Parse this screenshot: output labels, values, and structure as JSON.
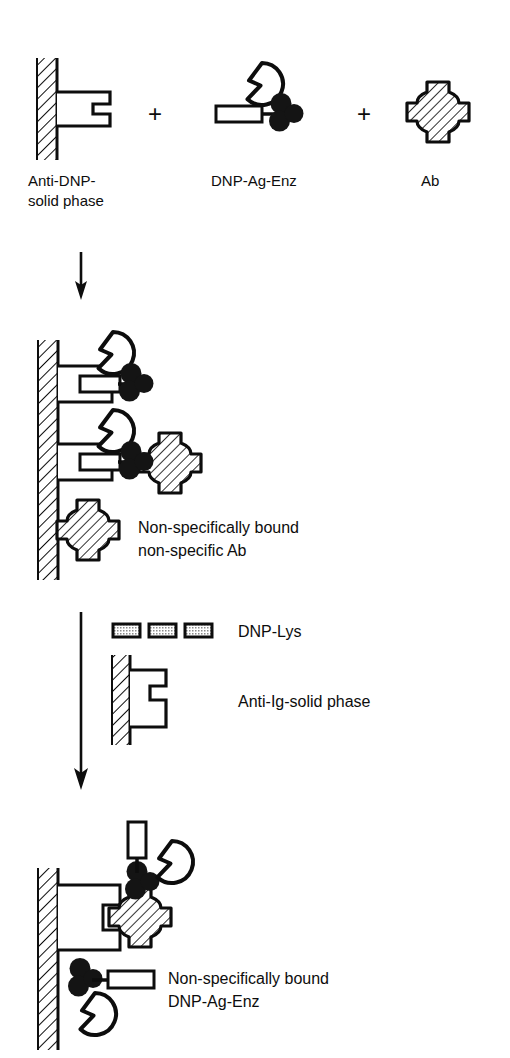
{
  "figure": {
    "type": "immunoassay-schematic",
    "title": "",
    "background": "#ffffff",
    "ink": "#0d0d0d",
    "fill_white": "#ffffff",
    "fill_black": "#141414",
    "fill_hatch": "#ffffff",
    "fill_stipple": "#b4b4b4"
  },
  "panels": [
    {
      "id": "reagents",
      "operator_1": "+",
      "operator_2": "+",
      "items": [
        {
          "id": "anti-dnp-solid-phase",
          "label_line1": "Anti-DNP-",
          "label_line2": "solid phase",
          "icon": "solid-phase-antibody"
        },
        {
          "id": "dnp-ag-enz",
          "label_line1": "DNP-Ag-Enz",
          "label_line2": "",
          "icon": "dnp-ag-enzyme-conjugate"
        },
        {
          "id": "ab",
          "label_line1": "Ab",
          "label_line2": "",
          "icon": "antibody-cross"
        }
      ]
    },
    {
      "id": "bound-complexes",
      "caption_line1": "Non-specifically  bound",
      "caption_line2": "non-specific Ab",
      "complexes": [
        {
          "id": "captured-dnp-ag-enz",
          "icon": "antibody-bound-conjugate"
        },
        {
          "id": "captured-conjugate-with-nonspecific-ab",
          "icon": "antibody-bound-conjugate-plus-ab"
        },
        {
          "id": "nonspecifically-bound-ab",
          "icon": "antibody-cross-on-wall"
        }
      ]
    },
    {
      "id": "reagents-step-2",
      "items": [
        {
          "id": "dnp-lys",
          "label": "DNP-Lys",
          "icon": "dnp-lys-bars",
          "bar_count": 3
        },
        {
          "id": "anti-ig-solid-phase",
          "label": "Anti-Ig-solid  phase",
          "icon": "solid-phase-antibody"
        }
      ]
    },
    {
      "id": "final-result",
      "caption_line1": "Non-specifically  bound",
      "caption_line2": "DNP-Ag-Enz",
      "complexes": [
        {
          "id": "ab-sandwich-with-dnp-lys",
          "icon": "antibody-ab-conjugate-sandwich"
        },
        {
          "id": "nonspecific-dnp-ag-enz-on-wall",
          "icon": "conjugate-on-wall"
        }
      ]
    }
  ],
  "arrows": [
    {
      "id": "arrow-step-1",
      "direction": "down"
    },
    {
      "id": "arrow-step-2",
      "direction": "down"
    }
  ]
}
